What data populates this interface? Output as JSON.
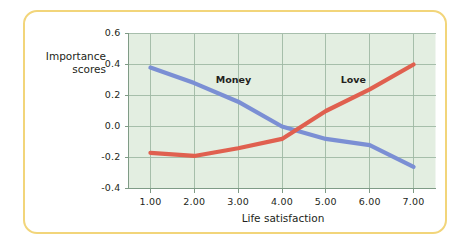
{
  "figure": {
    "frame_color": "#f2d57a",
    "background_color": "#ffffff"
  },
  "chart_data": {
    "type": "line",
    "title": "",
    "subtitle": "",
    "xlabel": "Life satisfaction",
    "ylabel": "Importance scores",
    "ylabel_line1": "Importance",
    "ylabel_line2": "scores",
    "plot_background_color": "#e3eee1",
    "grid": true,
    "grid_color": "#9fb8a4",
    "legend_position": "inline-labels",
    "x": [
      1,
      2,
      3,
      4,
      5,
      6,
      7
    ],
    "xticks": [
      "1.00",
      "2.00",
      "3.00",
      "4.00",
      "5.00",
      "6.00",
      "7.00"
    ],
    "yticks": [
      "0.6",
      "0.4",
      "0.2",
      "0.0",
      "-0.2",
      "-0.4"
    ],
    "ytick_values": [
      0.6,
      0.4,
      0.2,
      0.0,
      -0.2,
      -0.4
    ],
    "xlim": [
      0.5,
      7.5
    ],
    "ylim": [
      -0.4,
      0.6
    ],
    "series": [
      {
        "name": "Money",
        "color": "#7b8fd4",
        "values": [
          0.38,
          0.28,
          0.16,
          0.0,
          -0.08,
          -0.12,
          -0.26
        ]
      },
      {
        "name": "Love",
        "color": "#e0604f",
        "values": [
          -0.17,
          -0.19,
          -0.14,
          -0.08,
          0.1,
          0.24,
          0.4
        ]
      }
    ],
    "annotations": [
      {
        "text": "Money",
        "x": 2.9,
        "y": 0.3
      },
      {
        "text": "Love",
        "x": 5.75,
        "y": 0.3
      }
    ]
  }
}
